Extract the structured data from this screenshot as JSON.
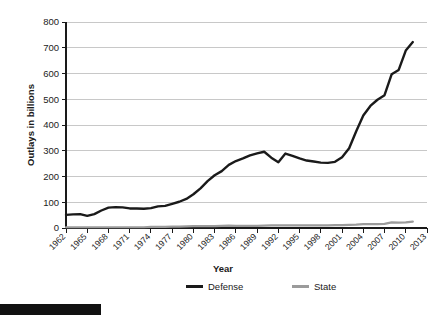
{
  "chart_data": {
    "type": "line",
    "title": "",
    "xlabel": "Year",
    "ylabel": "Outlays in billions",
    "xlim": [
      1962,
      2013
    ],
    "ylim": [
      0,
      800
    ],
    "ytick_step": 100,
    "yticks": [
      0,
      100,
      200,
      300,
      400,
      500,
      600,
      700,
      800
    ],
    "xticks": [
      1962,
      1965,
      1968,
      1971,
      1974,
      1977,
      1980,
      1983,
      1986,
      1989,
      1992,
      1995,
      1998,
      2001,
      2004,
      2007,
      2010,
      2013
    ],
    "grid": "horizontal",
    "legend_position": "bottom",
    "x": [
      1962,
      1963,
      1964,
      1965,
      1966,
      1967,
      1968,
      1969,
      1970,
      1971,
      1972,
      1973,
      1974,
      1975,
      1976,
      1977,
      1978,
      1979,
      1980,
      1981,
      1982,
      1983,
      1984,
      1985,
      1986,
      1987,
      1988,
      1989,
      1990,
      1991,
      1992,
      1993,
      1994,
      1995,
      1996,
      1997,
      1998,
      1999,
      2000,
      2001,
      2002,
      2003,
      2004,
      2005,
      2006,
      2007,
      2008,
      2009,
      2010,
      2011
    ],
    "series": [
      {
        "name": "Defense",
        "color": "#1a1a1a",
        "values": [
          51,
          53,
          54,
          47,
          54,
          68,
          79,
          81,
          80,
          76,
          76,
          75,
          77,
          84,
          86,
          94,
          102,
          113,
          131,
          154,
          182,
          205,
          221,
          245,
          260,
          270,
          282,
          290,
          296,
          273,
          255,
          289,
          280,
          270,
          262,
          258,
          254,
          253,
          257,
          275,
          310,
          376,
          437,
          474,
          498,
          516,
          597,
          614,
          689,
          722
        ]
      },
      {
        "name": "State",
        "color": "#9b9b9b",
        "values": [
          3,
          3,
          3,
          3,
          3,
          3,
          3,
          3,
          3,
          3,
          3,
          3,
          4,
          4,
          4,
          5,
          5,
          6,
          7,
          7,
          7,
          7,
          8,
          9,
          8,
          8,
          8,
          8,
          9,
          10,
          10,
          10,
          10,
          10,
          10,
          10,
          10,
          10,
          11,
          11,
          12,
          13,
          15,
          15,
          15,
          16,
          22,
          21,
          22,
          25
        ]
      }
    ],
    "legend": [
      {
        "label": "Defense",
        "color": "#1a1a1a"
      },
      {
        "label": "State",
        "color": "#9b9b9b"
      }
    ]
  },
  "page": {
    "footer_bar": ""
  }
}
